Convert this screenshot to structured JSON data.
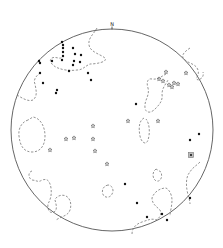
{
  "diagram": {
    "type": "stereonet",
    "north_label": "N",
    "net": {
      "cx": 112,
      "cy": 130,
      "r": 101
    },
    "colors": {
      "outline": "#555555",
      "contour": "#777777",
      "dot": "#111111",
      "star": "#666666",
      "square": "#bbbbbb"
    },
    "dots": [
      [
        62,
        42
      ],
      [
        63,
        45
      ],
      [
        63,
        48
      ],
      [
        39,
        61
      ],
      [
        40,
        63
      ],
      [
        73,
        48
      ],
      [
        81,
        55
      ],
      [
        75,
        54
      ],
      [
        63,
        52
      ],
      [
        63,
        56
      ],
      [
        52,
        61
      ],
      [
        74,
        61
      ],
      [
        62,
        60
      ],
      [
        80,
        62
      ],
      [
        73,
        65
      ],
      [
        40,
        73
      ],
      [
        69,
        71
      ],
      [
        88,
        73
      ],
      [
        43,
        83
      ],
      [
        91,
        80
      ],
      [
        57,
        90
      ],
      [
        56,
        93
      ],
      [
        136,
        104
      ],
      [
        199,
        134
      ],
      [
        190,
        140
      ],
      [
        125,
        184
      ],
      [
        137,
        203
      ],
      [
        147,
        217
      ],
      [
        162,
        214
      ],
      [
        167,
        220
      ],
      [
        190,
        198
      ]
    ],
    "stars": [
      [
        166,
        72
      ],
      [
        159,
        79
      ],
      [
        163,
        81
      ],
      [
        169,
        85
      ],
      [
        172,
        87
      ],
      [
        174,
        83
      ],
      [
        178,
        84
      ],
      [
        186,
        73
      ],
      [
        128,
        121
      ],
      [
        158,
        121
      ],
      [
        93,
        126
      ],
      [
        74,
        138
      ],
      [
        66,
        139
      ],
      [
        93,
        139
      ],
      [
        50,
        150
      ],
      [
        95,
        151
      ],
      [
        107,
        164
      ]
    ],
    "squares": [
      [
        191,
        155
      ]
    ],
    "contours": [
      "M97,28 C93,35 88,38 89,45 C90,52 100,54 105,58 C108,62 96,64 90,64 C85,66 83,70 77,70 C70,71 63,70 58,68 C52,66 48,60 52,58 C56,56 60,60 62,57",
      "M17,95 C22,98 28,102 33,100 C38,96 36,90 35,84 C33,80 36,76 40,73",
      "M190,48 C184,52 180,56 185,60 C190,64 196,64 198,70 C200,76 194,78 198,80 C202,79 204,76 203,72",
      "M166,74 C162,76 158,80 152,79 C148,78 146,82 148,88 C150,96 144,100 145,108 C146,114 152,113 156,108 C160,104 163,100 162,94 C162,88 166,84 168,80",
      "M28,120 C22,122 18,128 19,136 C20,146 24,152 32,152 C40,152 45,146 45,136 C45,126 40,118 33,117 Z",
      "M144,118 C140,120 138,126 140,136 C141,142 146,146 148,140 C150,134 150,124 146,119",
      "M156,169 C152,172 152,178 156,181 C160,182 163,178 161,172 Z",
      "M108,185 C102,186 101,193 104,196 C108,199 113,196 113,190 C112,186 110,185 108,185",
      "M32,171 C28,172 28,178 32,180 C36,180 38,183 42,180 C48,178 50,182 51,188 C52,196 50,200 48,204 C47,210 50,214 54,212 C58,210 56,204 55,200 C56,196 62,194 66,196 C70,198 72,204 70,210 C68,216 62,216 56,220",
      "M200,162 C196,166 192,168 190,172 C186,176 186,184 187,190 C188,196 190,200 190,204",
      "M132,234 C132,228 136,224 142,222 C148,220 152,218 156,220 C160,218 162,214 160,210 C156,206 152,204 152,198 C154,192 160,188 166,188 C170,190 172,196 172,200 C172,206 170,212 170,216"
    ]
  }
}
